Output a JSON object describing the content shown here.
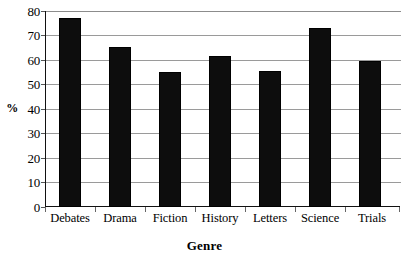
{
  "chart_data": {
    "type": "bar",
    "title": "",
    "categories": [
      "Debates",
      "Drama",
      "Fiction",
      "History",
      "Letters",
      "Science",
      "Trials"
    ],
    "values": [
      77,
      65.5,
      55,
      61.5,
      55.5,
      73,
      59.5
    ],
    "series": [
      {
        "name": "Percent",
        "values": [
          77,
          65.5,
          55,
          61.5,
          55.5,
          73,
          59.5
        ]
      }
    ],
    "xlabel": "Genre",
    "ylabel": "%",
    "ylim": [
      0,
      80
    ],
    "ytick_values": [
      0,
      10,
      20,
      30,
      40,
      50,
      60,
      70,
      80
    ],
    "ytick_labels": [
      "0",
      "10",
      "20",
      "30",
      "40",
      "50",
      "60",
      "70",
      "80"
    ],
    "grid": true,
    "grid_axis": "y",
    "legend": false,
    "legend_position": "none",
    "bar_color": "#0d0d0d",
    "gridline_color": "#9a9a9a",
    "axis_color": "#111111",
    "background_color": "#ffffff"
  },
  "axes": {
    "y_title": "%",
    "x_title": "Genre"
  }
}
